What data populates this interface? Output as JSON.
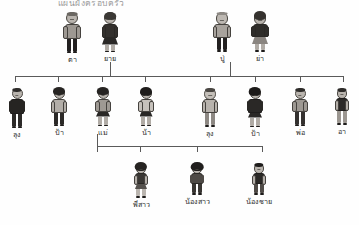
{
  "header": {
    "title": "แผนผังครอบครัว"
  },
  "diagram": {
    "type": "family-tree",
    "language": "Thai",
    "generations": 3,
    "line_color": "#5a5a5a",
    "background_color": "#fefefe"
  },
  "grandparents": {
    "maternal": [
      {
        "label": "ตา",
        "gender": "male",
        "x": 72,
        "y": 12
      },
      {
        "label": "ยาย",
        "gender": "female",
        "x": 110,
        "y": 12
      }
    ],
    "paternal": [
      {
        "label": "ปู่",
        "gender": "male",
        "x": 222,
        "y": 12
      },
      {
        "label": "ย่า",
        "gender": "female",
        "x": 260,
        "y": 12
      }
    ]
  },
  "parents_row": [
    {
      "label": "ลุง",
      "gender": "male",
      "x": 4,
      "y": 88
    },
    {
      "label": "ป้า",
      "gender": "female",
      "x": 46,
      "y": 88
    },
    {
      "label": "แม่",
      "gender": "female",
      "x": 90,
      "y": 88
    },
    {
      "label": "น้า",
      "gender": "female",
      "x": 133,
      "y": 88
    },
    {
      "label": "ลุง",
      "gender": "male",
      "x": 196,
      "y": 88
    },
    {
      "label": "ป้า",
      "gender": "female",
      "x": 240,
      "y": 88
    },
    {
      "label": "พ่อ",
      "gender": "male",
      "x": 284,
      "y": 88
    },
    {
      "label": "อา",
      "gender": "male",
      "x": 326,
      "y": 88
    }
  ],
  "children_row": [
    {
      "label": "พี่สาว",
      "gender": "female",
      "x": 126,
      "y": 163
    },
    {
      "label": "น้องสาว",
      "gender": "female",
      "x": 182,
      "y": 163
    },
    {
      "label": "น้องชาย",
      "gender": "male",
      "x": 244,
      "y": 163
    }
  ],
  "connectors": {
    "main_bar": {
      "x": 15,
      "y": 76,
      "width": 328
    },
    "main_bar_ticks": [
      15,
      58,
      102,
      145,
      210,
      255,
      300,
      343
    ],
    "maternal_drop_x": 110,
    "paternal_drop_x": 230,
    "child_bar": {
      "x": 97,
      "y": 146,
      "width": 165
    },
    "child_bar_ticks": [
      97,
      140,
      197,
      262
    ],
    "parent_drop_x": 97
  }
}
